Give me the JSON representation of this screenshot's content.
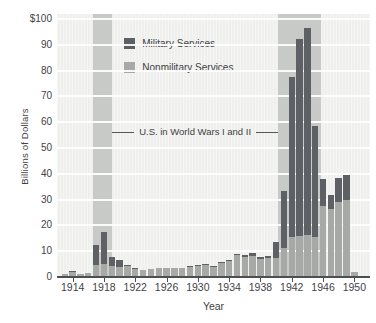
{
  "figure": {
    "kind": "textbook-style stacked bar chart",
    "background_color": "#ffffff"
  },
  "chart_data": {
    "type": "bar",
    "stacked": true,
    "title": "",
    "xlabel": "Year",
    "ylabel": "Billions of Dollars",
    "x_domain": [
      1912,
      1952
    ],
    "ylim": [
      0,
      100
    ],
    "grid": true,
    "y_tick_values": [
      0,
      10,
      20,
      30,
      40,
      50,
      60,
      70,
      80,
      90,
      100
    ],
    "y_tick_labels": [
      "0",
      "10",
      "20",
      "30",
      "40",
      "50",
      "60",
      "70",
      "80",
      "90",
      "$100"
    ],
    "x_tick_values": [
      1914,
      1918,
      1922,
      1926,
      1930,
      1934,
      1938,
      1942,
      1946,
      1950
    ],
    "x_tick_labels": [
      "1914",
      "1918",
      "1922",
      "1926",
      "1930",
      "1934",
      "1938",
      "1942",
      "1946",
      "1950"
    ],
    "categories": [
      1913,
      1914,
      1915,
      1916,
      1917,
      1918,
      1919,
      1920,
      1921,
      1922,
      1923,
      1924,
      1925,
      1926,
      1927,
      1928,
      1929,
      1930,
      1931,
      1932,
      1933,
      1934,
      1935,
      1936,
      1937,
      1938,
      1939,
      1940,
      1941,
      1942,
      1943,
      1944,
      1945,
      1946,
      1947,
      1948,
      1949,
      1950
    ],
    "series": [
      {
        "name": "Nonmilitary Services",
        "color": "#a7a9a7",
        "values": [
          0.6,
          1.5,
          0.8,
          1.2,
          4.3,
          4.7,
          3.8,
          3.4,
          3.9,
          2.9,
          2.5,
          2.8,
          3.0,
          3.0,
          3.2,
          3.0,
          3.4,
          4.0,
          4.4,
          3.4,
          5.2,
          5.9,
          8.0,
          7.2,
          7.8,
          6.5,
          6.8,
          7.0,
          11.0,
          15.0,
          15.5,
          16.0,
          15.0,
          27.0,
          26.0,
          28.5,
          29.5,
          1.5
        ]
      },
      {
        "name": "Military Services",
        "color": "#5d6165",
        "values": [
          0,
          0.5,
          0,
          0,
          7.8,
          12.5,
          3.5,
          3.0,
          0.4,
          0.3,
          0,
          0,
          0,
          0,
          0,
          0,
          0.3,
          0.4,
          0.4,
          0.3,
          0.4,
          0.5,
          0.7,
          0.8,
          1.3,
          0.9,
          1.1,
          6.0,
          22.0,
          62.0,
          76.5,
          80.0,
          43.0,
          10.5,
          5.5,
          9.5,
          9.5,
          0
        ]
      }
    ],
    "bands": [
      {
        "name": "World War I shading",
        "from": 1916.6,
        "to": 1919.0,
        "color": "#c8cac8"
      },
      {
        "name": "World War II shading",
        "from": 1940.3,
        "to": 1945.8,
        "color": "#c8cac8"
      }
    ],
    "annotation": {
      "text": "U.S. in World Wars I and II",
      "y_value": 56,
      "x_from": 1919.0,
      "x_to": 1940.3
    },
    "legend": {
      "position": "inside-top-left",
      "entries": [
        {
          "label": "Military Services",
          "color": "#5d6165"
        },
        {
          "label": "Nonmilitary Services",
          "color": "#a7a9a7"
        }
      ]
    }
  }
}
